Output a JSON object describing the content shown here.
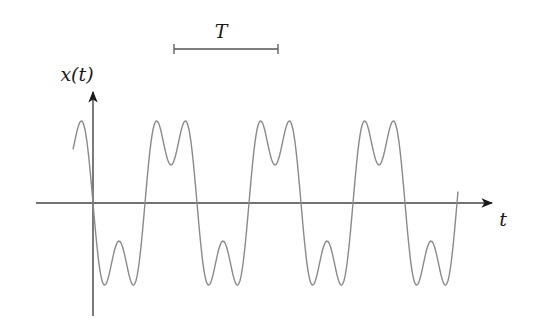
{
  "diagram": {
    "type": "periodic-signal-plot",
    "y_axis_label": "x(t)",
    "x_axis_label": "t",
    "period_label": "T",
    "signal": {
      "description": "Periodic odd-harmonic waveform (fundamental + 3rd harmonic) with double-humped peaks and troughs",
      "expression": "x(t) = -[sin(2πt/T) + 0.5·sin(6πt/T)]",
      "periods_shown": 3.6,
      "curve_color": "#8a8a8a",
      "axis_color": "#333333"
    },
    "period_bar": {
      "x_start_px": 174,
      "x_end_px": 278,
      "y_px": 49
    }
  }
}
